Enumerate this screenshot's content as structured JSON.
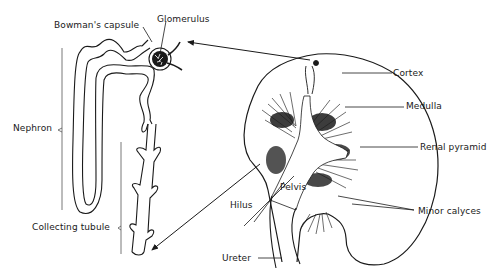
{
  "diagram": {
    "labels": {
      "bowmans_capsule": "Bowman's capsule",
      "glomerulus": "Glomerulus",
      "nephron": "Nephron",
      "collecting_tubule": "Collecting tubule",
      "cortex": "Cortex",
      "medulla": "Medulla",
      "renal_pyramid": "Renal pyramid",
      "pelvis": "Pelvis",
      "hilus": "Hilus",
      "minor_calyces": "Minor calyces",
      "ureter": "Ureter"
    },
    "colors": {
      "ink": "#1a1a1a",
      "background": "#ffffff"
    }
  }
}
